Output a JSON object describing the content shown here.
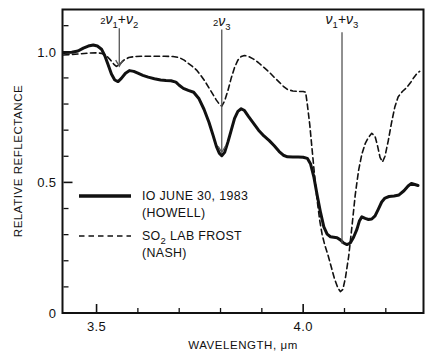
{
  "chart_data": {
    "type": "line",
    "title": "",
    "xlabel": "WAVELENGTH, μm",
    "ylabel": "RELATIVE REFLECTANCE",
    "xlim": [
      3.42,
      4.29
    ],
    "ylim": [
      0.0,
      1.16
    ],
    "grid": false,
    "x_ticks": [
      3.5,
      4.0
    ],
    "x_tick_labels": [
      "3.5",
      "4.0"
    ],
    "x_minor_ticks": [
      3.6,
      3.7,
      3.8,
      3.9,
      4.1,
      4.2
    ],
    "y_ticks": [
      0,
      0.5,
      1.0
    ],
    "y_tick_labels": [
      "0",
      "0.5",
      "1.0"
    ],
    "y_minor_ticks": [
      0.1,
      0.2,
      0.3,
      0.4,
      0.6,
      0.7,
      0.8,
      0.9,
      1.1
    ],
    "legend_position": "inside-left",
    "series": [
      {
        "name": "IO JUNE 30, 1983 (HOWELL)",
        "style": "solid",
        "color": "#111111",
        "width": 3.0,
        "points": [
          [
            3.42,
            0.997
          ],
          [
            3.44,
            0.998
          ],
          [
            3.455,
            1.003
          ],
          [
            3.468,
            1.014
          ],
          [
            3.48,
            1.022
          ],
          [
            3.492,
            1.026
          ],
          [
            3.502,
            1.022
          ],
          [
            3.512,
            1.01
          ],
          [
            3.52,
            0.985
          ],
          [
            3.528,
            0.95
          ],
          [
            3.536,
            0.915
          ],
          [
            3.544,
            0.892
          ],
          [
            3.552,
            0.886
          ],
          [
            3.56,
            0.898
          ],
          [
            3.57,
            0.918
          ],
          [
            3.58,
            0.928
          ],
          [
            3.59,
            0.925
          ],
          [
            3.6,
            0.918
          ],
          [
            3.612,
            0.91
          ],
          [
            3.625,
            0.903
          ],
          [
            3.64,
            0.897
          ],
          [
            3.655,
            0.892
          ],
          [
            3.668,
            0.89
          ],
          [
            3.68,
            0.889
          ],
          [
            3.692,
            0.884
          ],
          [
            3.7,
            0.872
          ],
          [
            3.71,
            0.86
          ],
          [
            3.722,
            0.852
          ],
          [
            3.735,
            0.845
          ],
          [
            3.748,
            0.82
          ],
          [
            3.76,
            0.78
          ],
          [
            3.772,
            0.73
          ],
          [
            3.782,
            0.68
          ],
          [
            3.79,
            0.638
          ],
          [
            3.797,
            0.612
          ],
          [
            3.803,
            0.602
          ],
          [
            3.81,
            0.615
          ],
          [
            3.818,
            0.655
          ],
          [
            3.826,
            0.7
          ],
          [
            3.834,
            0.745
          ],
          [
            3.842,
            0.772
          ],
          [
            3.85,
            0.782
          ],
          [
            3.858,
            0.775
          ],
          [
            3.868,
            0.752
          ],
          [
            3.88,
            0.726
          ],
          [
            3.892,
            0.7
          ],
          [
            3.905,
            0.678
          ],
          [
            3.918,
            0.66
          ],
          [
            3.93,
            0.64
          ],
          [
            3.942,
            0.618
          ],
          [
            3.952,
            0.604
          ],
          [
            3.962,
            0.598
          ],
          [
            3.975,
            0.597
          ],
          [
            3.988,
            0.597
          ],
          [
            4.0,
            0.596
          ],
          [
            4.01,
            0.592
          ],
          [
            4.018,
            0.57
          ],
          [
            4.026,
            0.52
          ],
          [
            4.034,
            0.45
          ],
          [
            4.042,
            0.385
          ],
          [
            4.05,
            0.33
          ],
          [
            4.058,
            0.302
          ],
          [
            4.066,
            0.292
          ],
          [
            4.074,
            0.29
          ],
          [
            4.082,
            0.288
          ],
          [
            4.09,
            0.28
          ],
          [
            4.098,
            0.268
          ],
          [
            4.106,
            0.262
          ],
          [
            4.114,
            0.268
          ],
          [
            4.122,
            0.29
          ],
          [
            4.13,
            0.32
          ],
          [
            4.136,
            0.352
          ],
          [
            4.142,
            0.368
          ],
          [
            4.15,
            0.362
          ],
          [
            4.158,
            0.358
          ],
          [
            4.166,
            0.36
          ],
          [
            4.174,
            0.372
          ],
          [
            4.182,
            0.398
          ],
          [
            4.19,
            0.425
          ],
          [
            4.198,
            0.44
          ],
          [
            4.208,
            0.446
          ],
          [
            4.22,
            0.448
          ],
          [
            4.232,
            0.452
          ],
          [
            4.244,
            0.468
          ],
          [
            4.254,
            0.486
          ],
          [
            4.262,
            0.496
          ],
          [
            4.27,
            0.492
          ],
          [
            4.278,
            0.488
          ]
        ]
      },
      {
        "name": "SO2 LAB FROST (NASH)",
        "style": "dashed",
        "color": "#111111",
        "width": 1.6,
        "points": [
          [
            3.42,
            0.988
          ],
          [
            3.44,
            0.99
          ],
          [
            3.46,
            0.992
          ],
          [
            3.48,
            0.995
          ],
          [
            3.498,
            0.996
          ],
          [
            3.512,
            0.994
          ],
          [
            3.524,
            0.985
          ],
          [
            3.534,
            0.968
          ],
          [
            3.542,
            0.952
          ],
          [
            3.548,
            0.944
          ],
          [
            3.556,
            0.952
          ],
          [
            3.566,
            0.968
          ],
          [
            3.578,
            0.978
          ],
          [
            3.592,
            0.982
          ],
          [
            3.608,
            0.983
          ],
          [
            3.625,
            0.983
          ],
          [
            3.645,
            0.983
          ],
          [
            3.665,
            0.983
          ],
          [
            3.685,
            0.982
          ],
          [
            3.7,
            0.978
          ],
          [
            3.712,
            0.968
          ],
          [
            3.722,
            0.956
          ],
          [
            3.732,
            0.944
          ],
          [
            3.742,
            0.93
          ],
          [
            3.752,
            0.91
          ],
          [
            3.762,
            0.888
          ],
          [
            3.772,
            0.862
          ],
          [
            3.782,
            0.836
          ],
          [
            3.79,
            0.815
          ],
          [
            3.797,
            0.8
          ],
          [
            3.803,
            0.792
          ],
          [
            3.81,
            0.812
          ],
          [
            3.818,
            0.852
          ],
          [
            3.826,
            0.9
          ],
          [
            3.834,
            0.94
          ],
          [
            3.842,
            0.968
          ],
          [
            3.85,
            0.982
          ],
          [
            3.858,
            0.986
          ],
          [
            3.868,
            0.982
          ],
          [
            3.88,
            0.972
          ],
          [
            3.892,
            0.958
          ],
          [
            3.905,
            0.94
          ],
          [
            3.918,
            0.922
          ],
          [
            3.93,
            0.902
          ],
          [
            3.942,
            0.884
          ],
          [
            3.952,
            0.868
          ],
          [
            3.962,
            0.856
          ],
          [
            3.975,
            0.85
          ],
          [
            3.988,
            0.848
          ],
          [
            4.0,
            0.848
          ],
          [
            4.006,
            0.845
          ],
          [
            4.01,
            0.8
          ],
          [
            4.016,
            0.72
          ],
          [
            4.022,
            0.62
          ],
          [
            4.028,
            0.52
          ],
          [
            4.034,
            0.43
          ],
          [
            4.04,
            0.355
          ],
          [
            4.046,
            0.3
          ],
          [
            4.052,
            0.262
          ],
          [
            4.06,
            0.222
          ],
          [
            4.068,
            0.176
          ],
          [
            4.076,
            0.13
          ],
          [
            4.084,
            0.096
          ],
          [
            4.09,
            0.082
          ],
          [
            4.096,
            0.09
          ],
          [
            4.102,
            0.132
          ],
          [
            4.11,
            0.215
          ],
          [
            4.118,
            0.33
          ],
          [
            4.126,
            0.452
          ],
          [
            4.134,
            0.545
          ],
          [
            4.142,
            0.608
          ],
          [
            4.15,
            0.648
          ],
          [
            4.158,
            0.672
          ],
          [
            4.166,
            0.688
          ],
          [
            4.174,
            0.676
          ],
          [
            4.18,
            0.64
          ],
          [
            4.186,
            0.596
          ],
          [
            4.192,
            0.578
          ],
          [
            4.198,
            0.6
          ],
          [
            4.206,
            0.66
          ],
          [
            4.214,
            0.73
          ],
          [
            4.222,
            0.79
          ],
          [
            4.23,
            0.828
          ],
          [
            4.24,
            0.848
          ],
          [
            4.25,
            0.862
          ],
          [
            4.26,
            0.882
          ],
          [
            4.268,
            0.902
          ],
          [
            4.276,
            0.918
          ],
          [
            4.282,
            0.925
          ]
        ]
      }
    ],
    "annotations": [
      {
        "id": "two-nu1-plus-nu2",
        "label_parts": [
          "2",
          "ν",
          "1",
          "+",
          "ν",
          "2"
        ],
        "label_plain": "2ν1 + ν2",
        "x": 3.555,
        "marker": "arrow",
        "arrow_y_top": 1.09,
        "arrow_y_bottom": 0.945
      },
      {
        "id": "two-nu3",
        "label_parts": [
          "2",
          "ν",
          "3"
        ],
        "label_plain": "2ν3",
        "x": 3.803,
        "marker": "arrow",
        "arrow_y_top": 1.085,
        "arrow_y_bottom": 0.615
      },
      {
        "id": "nu1-plus-nu3",
        "label_parts": [
          "ν",
          "1",
          "+",
          "ν",
          "3"
        ],
        "label_plain": "ν1 + ν3",
        "x": 4.094,
        "marker": "line",
        "arrow_y_top": 1.075,
        "arrow_y_bottom": 0.265
      }
    ],
    "legend": [
      {
        "style": "solid",
        "line1": "IO JUNE 30, 1983",
        "line2": "(HOWELL)"
      },
      {
        "style": "dashed",
        "line1_pre": "SO",
        "line1_sub": "2",
        "line1_post": " LAB FROST",
        "line2": "(NASH)"
      }
    ]
  }
}
